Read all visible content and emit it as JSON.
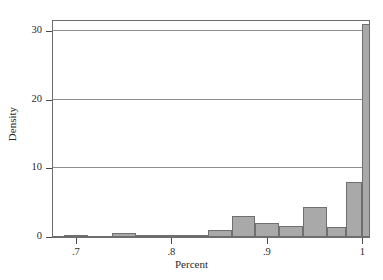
{
  "chart_data": {
    "type": "bar",
    "title": "",
    "subtitle": "",
    "xlabel": "Percent",
    "ylabel": "Density",
    "xlim": [
      0.675,
      1.008
    ],
    "ylim": [
      0,
      31.6
    ],
    "grid": "horizontal",
    "legend": "none",
    "bar_style": {
      "fill": "#a9a9a9",
      "edge": "#6f6f6f",
      "bin_width": 0.025
    },
    "xticks": [
      {
        "value": 0.7,
        "label": ".7"
      },
      {
        "value": 0.8,
        "label": ".8"
      },
      {
        "value": 0.9,
        "label": ".9"
      },
      {
        "value": 1.0,
        "label": "1"
      }
    ],
    "yticks": [
      {
        "value": 0,
        "label": "0"
      },
      {
        "value": 10,
        "label": "10"
      },
      {
        "value": 20,
        "label": "20"
      },
      {
        "value": 30,
        "label": "30"
      }
    ],
    "bins": [
      {
        "x0": 0.688,
        "x1": 0.713,
        "value": 0.35
      },
      {
        "x0": 0.713,
        "x1": 0.738,
        "value": 0.0
      },
      {
        "x0": 0.738,
        "x1": 0.763,
        "value": 0.6
      },
      {
        "x0": 0.763,
        "x1": 0.788,
        "value": 0.25
      },
      {
        "x0": 0.788,
        "x1": 0.813,
        "value": 0.1
      },
      {
        "x0": 0.813,
        "x1": 0.838,
        "value": 0.2
      },
      {
        "x0": 0.838,
        "x1": 0.863,
        "value": 1.0
      },
      {
        "x0": 0.863,
        "x1": 0.888,
        "value": 3.0
      },
      {
        "x0": 0.888,
        "x1": 0.913,
        "value": 2.0
      },
      {
        "x0": 0.913,
        "x1": 0.938,
        "value": 1.65
      },
      {
        "x0": 0.938,
        "x1": 0.963,
        "value": 4.3
      },
      {
        "x0": 0.963,
        "x1": 0.983,
        "value": 1.5
      },
      {
        "x0": 0.983,
        "x1": 1.0,
        "value": 8.0
      },
      {
        "x0": 1.0,
        "x1": 1.008,
        "value": 31.0
      }
    ],
    "categories": [
      "0.688-0.713",
      "0.713-0.738",
      "0.738-0.763",
      "0.763-0.788",
      "0.788-0.813",
      "0.813-0.838",
      "0.838-0.863",
      "0.863-0.888",
      "0.888-0.913",
      "0.913-0.938",
      "0.938-0.963",
      "0.963-0.983",
      "0.983-1.0",
      "1.0-1.008"
    ],
    "values": [
      0.35,
      0.0,
      0.6,
      0.25,
      0.1,
      0.2,
      1.0,
      3.0,
      2.0,
      1.65,
      4.3,
      1.5,
      8.0,
      31.0
    ]
  }
}
